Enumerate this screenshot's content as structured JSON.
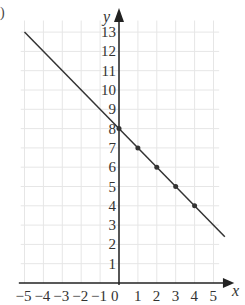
{
  "chart_data": {
    "type": "line",
    "title": "",
    "part_label": ")",
    "xlabel": "x",
    "ylabel": "y",
    "xlim": [
      -5,
      5
    ],
    "ylim": [
      0,
      13
    ],
    "grid": true,
    "x_ticks": [
      "-5",
      "-4",
      "-3",
      "-2",
      "-1",
      "0",
      "1",
      "2",
      "3",
      "4",
      "5"
    ],
    "y_ticks": [
      "1",
      "2",
      "3",
      "4",
      "5",
      "6",
      "7",
      "8",
      "9",
      "10",
      "11",
      "12",
      "13"
    ],
    "line": {
      "equation": "y = -x + 8",
      "x_start": -5,
      "y_start": 13,
      "x_end": 5.6,
      "y_end": 2.4
    },
    "points": [
      {
        "x": 0,
        "y": 8
      },
      {
        "x": 1,
        "y": 7
      },
      {
        "x": 2,
        "y": 6
      },
      {
        "x": 3,
        "y": 5
      },
      {
        "x": 4,
        "y": 4
      }
    ],
    "colors": {
      "line": "#333333",
      "grid": "#e6e6e6",
      "axis": "#222222"
    }
  }
}
